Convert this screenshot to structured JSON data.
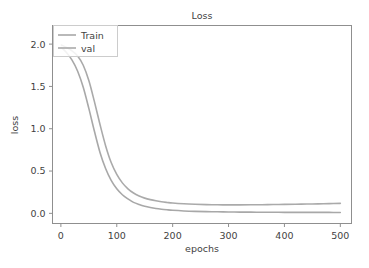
{
  "chart_data": {
    "type": "line",
    "title": "Loss",
    "xlabel": "epochs",
    "ylabel": "loss",
    "xlim": [
      -15,
      520
    ],
    "ylim": [
      -0.12,
      2.22
    ],
    "grid": false,
    "legend_position": "upper left",
    "xticks": [
      0,
      100,
      200,
      300,
      400,
      500
    ],
    "xtick_labels": [
      "0",
      "100",
      "200",
      "300",
      "400",
      "500"
    ],
    "yticks": [
      0.0,
      0.5,
      1.0,
      1.5,
      2.0
    ],
    "ytick_labels": [
      "0.0",
      "0.5",
      "1.0",
      "1.5",
      "2.0"
    ],
    "x": [
      1,
      10,
      20,
      30,
      40,
      50,
      60,
      70,
      80,
      90,
      100,
      110,
      120,
      130,
      140,
      150,
      160,
      170,
      180,
      190,
      200,
      220,
      240,
      260,
      280,
      300,
      320,
      340,
      360,
      380,
      400,
      420,
      440,
      460,
      480,
      500
    ],
    "series": [
      {
        "name": "Train",
        "color": "#a8a8a8",
        "values": [
          1.96,
          1.9,
          1.81,
          1.68,
          1.49,
          1.24,
          0.97,
          0.72,
          0.53,
          0.39,
          0.29,
          0.22,
          0.17,
          0.13,
          0.105,
          0.085,
          0.07,
          0.058,
          0.049,
          0.042,
          0.036,
          0.028,
          0.023,
          0.02,
          0.018,
          0.016,
          0.015,
          0.014,
          0.013,
          0.013,
          0.012,
          0.012,
          0.011,
          0.011,
          0.011,
          0.01
        ]
      },
      {
        "name": "val",
        "color": "#aaaaaa",
        "values": [
          1.99,
          1.96,
          1.92,
          1.86,
          1.75,
          1.57,
          1.32,
          1.05,
          0.8,
          0.6,
          0.46,
          0.36,
          0.29,
          0.24,
          0.205,
          0.18,
          0.162,
          0.148,
          0.137,
          0.129,
          0.122,
          0.113,
          0.107,
          0.103,
          0.101,
          0.1,
          0.1,
          0.101,
          0.102,
          0.104,
          0.106,
          0.108,
          0.11,
          0.112,
          0.115,
          0.118
        ]
      }
    ]
  },
  "figure": {
    "title": "Loss",
    "xlabel": "epochs",
    "ylabel": "loss"
  },
  "legend": {
    "entries": [
      {
        "label": "Train"
      },
      {
        "label": "val"
      }
    ]
  }
}
